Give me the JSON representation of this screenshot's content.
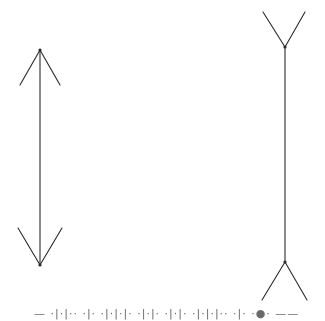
{
  "diagram": {
    "stroke_color": "#2a2a2a",
    "left_figure": {
      "label": "arrowheads-inward",
      "shaft": {
        "x": 40,
        "y1": 50,
        "y2": 265
      },
      "top_fins": [
        {
          "x": 20,
          "y": 85
        },
        {
          "x": 60,
          "y": 85
        }
      ],
      "bottom_fins": [
        {
          "x": 18,
          "y": 228
        },
        {
          "x": 62,
          "y": 228
        }
      ]
    },
    "right_figure": {
      "label": "fins-outward",
      "shaft": {
        "x": 285,
        "y1": 47,
        "y2": 262
      },
      "top_fins": [
        {
          "x": 263,
          "y": 12
        },
        {
          "x": 305,
          "y": 12
        }
      ],
      "bottom_fins": [
        {
          "x": 262,
          "y": 300
        },
        {
          "x": 307,
          "y": 300
        }
      ]
    }
  },
  "caption": {
    "text": "— ·|·|·· ·|· ·|·|·|· ·|·|· ·|·|· ·|·|·|·· ·|· ·●· ——"
  }
}
